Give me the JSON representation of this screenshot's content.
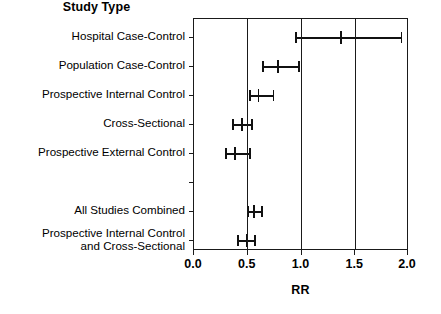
{
  "chart_data": {
    "type": "scatter",
    "subtype": "forest-plot",
    "title": "Study Type",
    "xlabel": "RR",
    "ylabel": "",
    "xlim": [
      0.0,
      2.0
    ],
    "xticks": [
      0.0,
      0.5,
      1.0,
      1.5,
      2.0
    ],
    "xticklabels": [
      "0.0",
      "0.5",
      "1.0",
      "1.5",
      "2.0"
    ],
    "grid": "vertical gridlines at 0.5, 1.0, 1.5",
    "legend": "none",
    "reference_line": 1.0,
    "categories": [
      "Hospital Case-Control",
      "Population Case-Control",
      "Prospective Internal Control",
      "Cross-Sectional",
      "Prospective External Control",
      "",
      "All Studies Combined",
      "Prospective Internal Control\nand Cross-Sectional"
    ],
    "rows": [
      {
        "label": "Hospital Case-Control",
        "estimate": 1.37,
        "ci_low": 0.95,
        "ci_high": 1.93,
        "spacer": false
      },
      {
        "label": "Population Case-Control",
        "estimate": 0.78,
        "ci_low": 0.64,
        "ci_high": 0.98,
        "spacer": false
      },
      {
        "label": "Prospective Internal Control",
        "estimate": 0.6,
        "ci_low": 0.52,
        "ci_high": 0.74,
        "spacer": false
      },
      {
        "label": "Cross-Sectional",
        "estimate": 0.45,
        "ci_low": 0.36,
        "ci_high": 0.54,
        "spacer": false
      },
      {
        "label": "Prospective External Control",
        "estimate": 0.38,
        "ci_low": 0.3,
        "ci_high": 0.52,
        "spacer": false
      },
      {
        "label": "",
        "estimate": null,
        "ci_low": null,
        "ci_high": null,
        "spacer": true
      },
      {
        "label": "All Studies Combined",
        "estimate": 0.56,
        "ci_low": 0.5,
        "ci_high": 0.63,
        "spacer": false
      },
      {
        "label": "Prospective Internal Control\nand Cross-Sectional",
        "estimate": 0.49,
        "ci_low": 0.41,
        "ci_high": 0.57,
        "spacer": false
      }
    ],
    "series": [
      {
        "name": "Relative Risk",
        "values": [
          1.37,
          0.78,
          0.6,
          0.45,
          0.38,
          null,
          0.56,
          0.49
        ],
        "ci_low": [
          0.95,
          0.64,
          0.52,
          0.36,
          0.3,
          null,
          0.5,
          0.41
        ],
        "ci_high": [
          1.93,
          0.98,
          0.74,
          0.54,
          0.52,
          null,
          0.63,
          0.57
        ]
      }
    ]
  },
  "style": {
    "ink": "#111111",
    "axis": "#1a1a1a",
    "background": "#ffffff"
  }
}
